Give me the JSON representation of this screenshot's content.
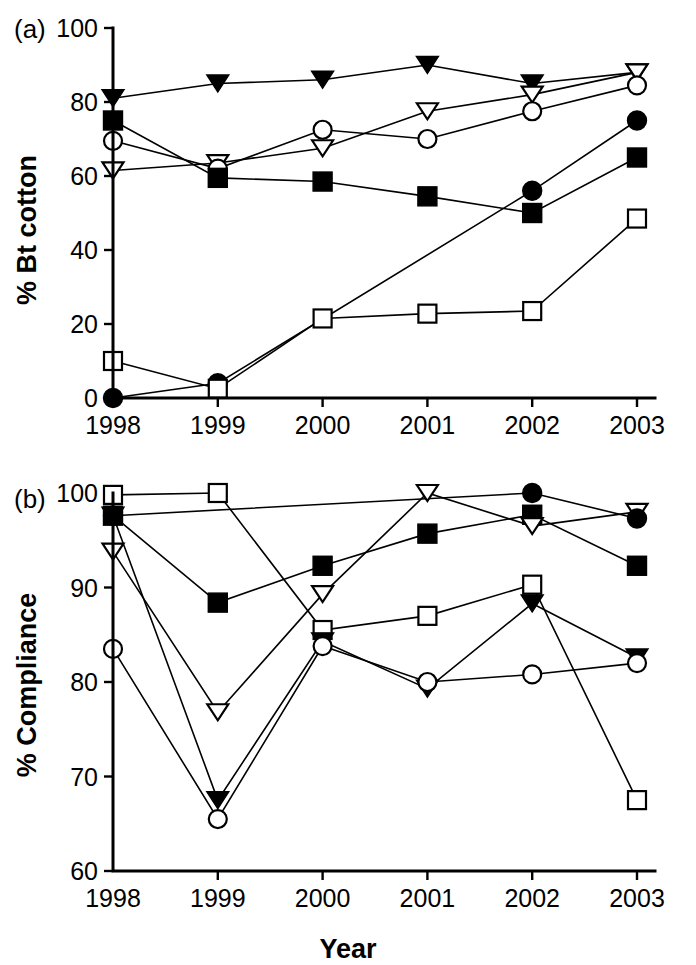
{
  "figure": {
    "xlabel": "Year",
    "panels": [
      {
        "key": "a",
        "label": "(a)",
        "ylabel": "% Bt cotton"
      },
      {
        "key": "b",
        "label": "(b)",
        "ylabel": "% Compliance"
      }
    ]
  },
  "chart_data": [
    {
      "type": "line",
      "panel": "(a)",
      "title": "",
      "xlabel": "",
      "ylabel": "% Bt cotton",
      "x": [
        1998,
        1999,
        2000,
        2001,
        2002,
        2003
      ],
      "categories": [
        "1998",
        "1999",
        "2000",
        "2001",
        "2002",
        "2003"
      ],
      "xticklabels": [
        "1998",
        "1999",
        "2000",
        "2001",
        "2002",
        "2003"
      ],
      "yticks": [
        0,
        20,
        40,
        60,
        80,
        100
      ],
      "yticklabels": [
        "0",
        "20",
        "40",
        "60",
        "80",
        "100"
      ],
      "ylim": [
        0,
        100
      ],
      "xlim": [
        1998,
        2003
      ],
      "grid": false,
      "legend": "none",
      "series": [
        {
          "name": "filled-triangle-down",
          "marker": "triangle-down",
          "fill": "filled",
          "values": [
            81.0,
            85.0,
            86.0,
            90.0,
            85.0,
            88.0
          ]
        },
        {
          "name": "open-triangle-down",
          "marker": "triangle-down",
          "fill": "open",
          "values": [
            61.5,
            63.5,
            67.5,
            77.5,
            82.0,
            88.0
          ]
        },
        {
          "name": "open-circle",
          "marker": "circle",
          "fill": "open",
          "values": [
            69.5,
            62.0,
            72.5,
            70.0,
            77.5,
            84.5
          ]
        },
        {
          "name": "filled-square",
          "marker": "square",
          "fill": "filled",
          "values": [
            75.0,
            59.5,
            58.5,
            54.5,
            50.0,
            65.0
          ]
        },
        {
          "name": "filled-circle",
          "marker": "circle",
          "fill": "filled",
          "values": [
            0.0,
            4.0,
            null,
            null,
            56.0,
            75.0
          ]
        },
        {
          "name": "open-square",
          "marker": "square",
          "fill": "open",
          "values": [
            10.0,
            2.5,
            21.5,
            22.8,
            23.5,
            48.5
          ]
        }
      ]
    },
    {
      "type": "line",
      "panel": "(b)",
      "title": "",
      "xlabel": "Year",
      "ylabel": "% Compliance",
      "x": [
        1998,
        1999,
        2000,
        2001,
        2002,
        2003
      ],
      "categories": [
        "1998",
        "1999",
        "2000",
        "2001",
        "2002",
        "2003"
      ],
      "xticklabels": [
        "1998",
        "1999",
        "2000",
        "2001",
        "2002",
        "2003"
      ],
      "yticks": [
        60,
        70,
        80,
        90,
        100
      ],
      "yticklabels": [
        "60",
        "70",
        "80",
        "90",
        "100"
      ],
      "ylim": [
        60,
        100
      ],
      "xlim": [
        1998,
        2003
      ],
      "grid": false,
      "legend": "none",
      "series": [
        {
          "name": "open-square",
          "marker": "square",
          "fill": "open",
          "values": [
            99.8,
            100.0,
            85.5,
            87.0,
            90.3,
            67.5
          ]
        },
        {
          "name": "filled-square",
          "marker": "square",
          "fill": "filled",
          "values": [
            97.6,
            88.4,
            92.3,
            95.7,
            97.7,
            92.3
          ]
        },
        {
          "name": "open-triangle-down",
          "marker": "triangle-down",
          "fill": "open",
          "values": [
            93.8,
            76.8,
            89.3,
            100.0,
            96.5,
            98.0
          ]
        },
        {
          "name": "filled-triangle-down",
          "marker": "triangle-down",
          "fill": "filled",
          "values": [
            97.6,
            67.5,
            84.3,
            79.3,
            88.3,
            82.6
          ]
        },
        {
          "name": "open-circle",
          "marker": "circle",
          "fill": "open",
          "values": [
            83.5,
            65.5,
            83.8,
            80.0,
            80.8,
            82.0
          ]
        },
        {
          "name": "filled-circle",
          "marker": "circle",
          "fill": "filled",
          "values": [
            97.6,
            null,
            null,
            null,
            100.0,
            97.3
          ]
        }
      ]
    }
  ]
}
